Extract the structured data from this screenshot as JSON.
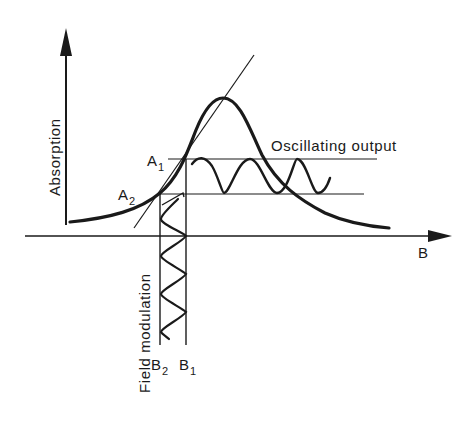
{
  "diagram": {
    "type": "ESR/NMR field-modulation detection schematic",
    "colors": {
      "ink": "#1a1a1a",
      "background": "#ffffff"
    },
    "axes": {
      "y_label": "Absorption",
      "x_label": "B"
    },
    "curve": {
      "name": "absorption-line",
      "shape": "bell-shaped absorption curve with tangent line at inflection"
    },
    "levels": {
      "upper": {
        "label": "A",
        "subscript": "1"
      },
      "lower": {
        "label": "A",
        "subscript": "2"
      }
    },
    "field_points": {
      "left": {
        "label": "B",
        "subscript": "2"
      },
      "right": {
        "label": "B",
        "subscript": "1"
      }
    },
    "annotations": {
      "oscillating_output": "Oscillating output",
      "field_modulation": "Field modulation"
    }
  }
}
